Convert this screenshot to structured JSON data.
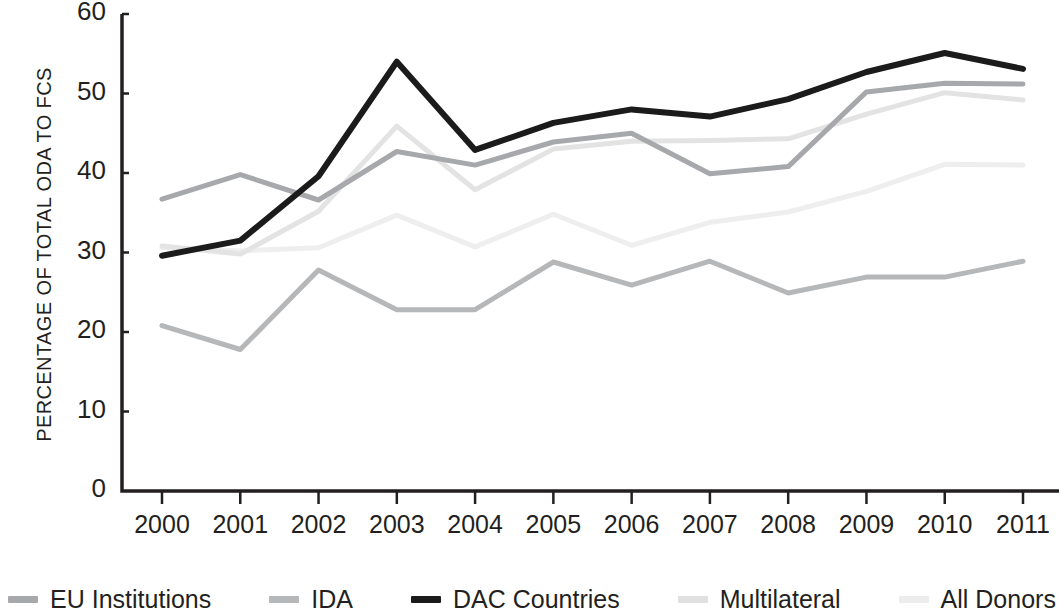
{
  "chart_data": {
    "type": "line",
    "title": "",
    "xlabel": "",
    "ylabel": "PERCENTAGE OF TOTAL ODA TO FCS",
    "categories": [
      "2000",
      "2001",
      "2002",
      "2003",
      "2004",
      "2005",
      "2006",
      "2007",
      "2008",
      "2009",
      "2010",
      "2011"
    ],
    "x": [
      2000,
      2001,
      2002,
      2003,
      2004,
      2005,
      2006,
      2007,
      2008,
      2009,
      2010,
      2011
    ],
    "ylim": [
      0,
      60
    ],
    "yticks": [
      "0",
      "10",
      "20",
      "30",
      "40",
      "50",
      "60"
    ],
    "ytick_values": [
      0,
      10,
      20,
      30,
      40,
      50,
      60
    ],
    "grid": false,
    "legend_position": "bottom",
    "series": [
      {
        "name": "EU Institutions",
        "color": "#a6a8ab",
        "width": 5,
        "values": [
          36.7,
          39.8,
          36.6,
          42.7,
          41.0,
          43.9,
          45.0,
          39.9,
          40.8,
          50.2,
          51.3,
          51.2
        ]
      },
      {
        "name": "IDA",
        "color": "#b5b7b9",
        "width": 5,
        "values": [
          20.8,
          17.8,
          27.8,
          22.8,
          22.8,
          28.8,
          25.9,
          28.9,
          24.9,
          26.9,
          26.9,
          28.9
        ]
      },
      {
        "name": "DAC Countries",
        "color": "#1b1b1b",
        "width": 6,
        "values": [
          29.6,
          31.5,
          39.6,
          54.0,
          42.9,
          46.3,
          48.0,
          47.1,
          49.3,
          52.7,
          55.1,
          53.1
        ]
      },
      {
        "name": "Multilateral",
        "color": "#e3e3e4",
        "width": 5,
        "values": [
          30.8,
          29.8,
          35.2,
          45.9,
          37.9,
          43.0,
          44.0,
          44.1,
          44.3,
          47.4,
          50.1,
          49.2
        ]
      },
      {
        "name": "All Donors",
        "color": "#eeeeef",
        "width": 5,
        "values": [
          30.6,
          30.2,
          30.6,
          34.7,
          30.7,
          34.8,
          30.9,
          33.8,
          35.1,
          37.7,
          41.1,
          41.0
        ]
      }
    ]
  },
  "axis": {
    "axis_color": "#231f20",
    "y_axis_label": "PERCENTAGE OF TOTAL ODA TO FCS"
  },
  "legend": {
    "items": [
      {
        "label": "EU Institutions",
        "color": "#a6a8ab"
      },
      {
        "label": "IDA",
        "color": "#b5b7b9"
      },
      {
        "label": "DAC Countries",
        "color": "#1b1b1b"
      },
      {
        "label": "Multilateral",
        "color": "#e0e0e1"
      },
      {
        "label": "All Donors",
        "color": "#ededee"
      }
    ]
  }
}
